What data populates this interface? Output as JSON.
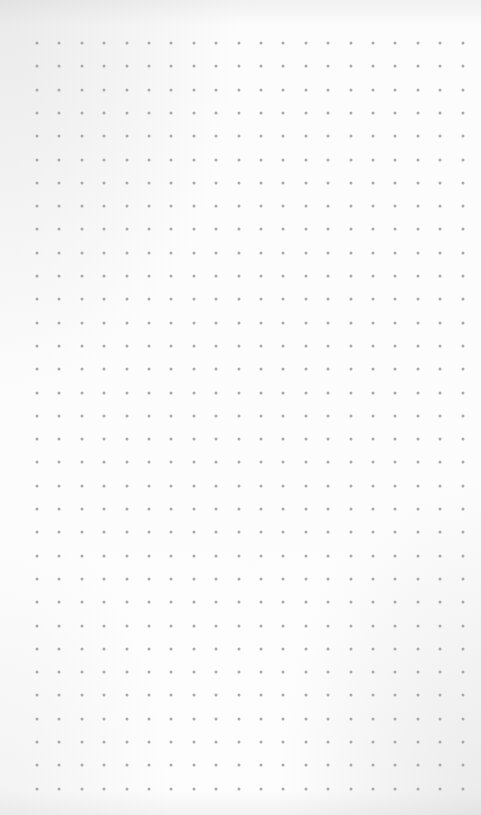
{
  "image": {
    "subject": "dot-grid paper",
    "background_color": "#fbfbfb",
    "dot_color": "#a9a9a9"
  },
  "grid": {
    "columns": 20,
    "rows": 33,
    "origin_x": 37,
    "origin_y": 43,
    "spacing_x": 22.4,
    "spacing_y": 23.3,
    "dot_size": 3
  }
}
